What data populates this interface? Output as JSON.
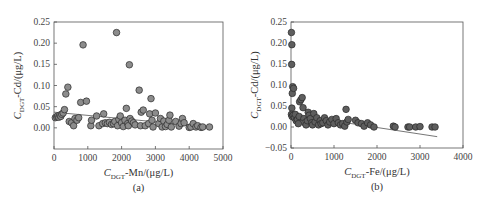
{
  "chart_data": [
    {
      "type": "scatter",
      "panel_label": "(a)",
      "title": "",
      "xlabel": "C_DGT-Mn/(μg/L)",
      "xlabel_parts": {
        "main": "C",
        "sub": "DGT",
        "rest": "-Mn/(μg/L)"
      },
      "ylabel": "C_DGT-Cd/(μg/L)",
      "ylabel_parts": {
        "main": "C",
        "sub": "DGT",
        "rest": "-Cd/(μg/L)"
      },
      "xlim": [
        0,
        5000
      ],
      "ylim": [
        -0.05,
        0.25
      ],
      "xticks": [
        "0",
        "1000",
        "2000",
        "3000",
        "4000",
        "5000"
      ],
      "yticks": [
        "0.00",
        "0.05",
        "0.10",
        "0.15",
        "0.20",
        "0.25"
      ],
      "grid": false,
      "marker_color": "#8c8c8c",
      "trendline": {
        "x": [
          0,
          4600
        ],
        "y": [
          0.037,
          0.002
        ]
      },
      "points": [
        [
          40,
          0.024
        ],
        [
          80,
          0.026
        ],
        [
          110,
          0.028
        ],
        [
          140,
          0.025
        ],
        [
          170,
          0.03
        ],
        [
          200,
          0.027
        ],
        [
          230,
          0.032
        ],
        [
          270,
          0.035
        ],
        [
          310,
          0.043
        ],
        [
          350,
          0.08
        ],
        [
          410,
          0.096
        ],
        [
          450,
          0.015
        ],
        [
          520,
          0.012
        ],
        [
          580,
          0.005
        ],
        [
          620,
          0.022
        ],
        [
          680,
          0.018
        ],
        [
          730,
          0.024
        ],
        [
          790,
          0.06
        ],
        [
          860,
          0.196
        ],
        [
          960,
          0.063
        ],
        [
          1090,
          0.005
        ],
        [
          1110,
          0.018
        ],
        [
          1260,
          0.028
        ],
        [
          1330,
          0.005
        ],
        [
          1440,
          0.01
        ],
        [
          1470,
          0.033
        ],
        [
          1520,
          0.012
        ],
        [
          1580,
          0.01
        ],
        [
          1640,
          0.013
        ],
        [
          1700,
          0.008
        ],
        [
          1760,
          0.01
        ],
        [
          1800,
          0.015
        ],
        [
          1850,
          0.225
        ],
        [
          1880,
          0.005
        ],
        [
          1920,
          0.02
        ],
        [
          1960,
          0.028
        ],
        [
          2000,
          0.012
        ],
        [
          2050,
          0.003
        ],
        [
          2100,
          0.018
        ],
        [
          2140,
          0.046
        ],
        [
          2180,
          0.01
        ],
        [
          2200,
          0.005
        ],
        [
          2230,
          0.149
        ],
        [
          2250,
          0.022
        ],
        [
          2300,
          0.016
        ],
        [
          2350,
          0.012
        ],
        [
          2400,
          0.007
        ],
        [
          2520,
          0.089
        ],
        [
          2560,
          0.005
        ],
        [
          2580,
          0.037
        ],
        [
          2640,
          0.042
        ],
        [
          2700,
          0.005
        ],
        [
          2800,
          0.01
        ],
        [
          2830,
          0.033
        ],
        [
          2870,
          0.069
        ],
        [
          2900,
          0.018
        ],
        [
          2930,
          0.002
        ],
        [
          3000,
          0.035
        ],
        [
          3100,
          0.01
        ],
        [
          3150,
          0.022
        ],
        [
          3200,
          0.002
        ],
        [
          3250,
          0.016
        ],
        [
          3300,
          0.003
        ],
        [
          3350,
          0.008
        ],
        [
          3400,
          0.018
        ],
        [
          3430,
          0.03
        ],
        [
          3470,
          0.002
        ],
        [
          3600,
          0.015
        ],
        [
          3700,
          0.004
        ],
        [
          3760,
          0.01
        ],
        [
          3800,
          0.022
        ],
        [
          3850,
          0.012
        ],
        [
          4000,
          0.001
        ],
        [
          4050,
          0.002
        ],
        [
          4120,
          0.01
        ],
        [
          4200,
          0.002
        ],
        [
          4250,
          0.005
        ],
        [
          4350,
          0.001
        ],
        [
          4400,
          0.002
        ],
        [
          4600,
          0.002
        ]
      ]
    },
    {
      "type": "scatter",
      "panel_label": "(b)",
      "title": "",
      "xlabel": "C_DGT-Fe/(μg/L)",
      "xlabel_parts": {
        "main": "C",
        "sub": "DGT",
        "rest": "-Fe/(μg/L)"
      },
      "ylabel": "C_DGT-Cd/(μg/L)",
      "ylabel_parts": {
        "main": "C",
        "sub": "DGT",
        "rest": "-Cd/(μg/L)"
      },
      "xlim": [
        0,
        4000
      ],
      "ylim": [
        -0.05,
        0.25
      ],
      "xticks": [
        "0",
        "1000",
        "2000",
        "3000",
        "4000"
      ],
      "yticks": [
        "-0.05",
        "0.00",
        "0.05",
        "0.10",
        "0.15",
        "0.20",
        "0.25"
      ],
      "grid": false,
      "marker_color": "#5e5e5e",
      "trendline": {
        "x": [
          0,
          3400
        ],
        "y": [
          0.03,
          -0.023
        ]
      },
      "points": [
        [
          10,
          0.225
        ],
        [
          20,
          0.196
        ],
        [
          15,
          0.149
        ],
        [
          30,
          0.08
        ],
        [
          40,
          0.096
        ],
        [
          60,
          0.092
        ],
        [
          20,
          0.045
        ],
        [
          10,
          0.03
        ],
        [
          25,
          0.025
        ],
        [
          50,
          0.028
        ],
        [
          80,
          0.022
        ],
        [
          100,
          0.03
        ],
        [
          120,
          0.015
        ],
        [
          150,
          0.018
        ],
        [
          170,
          0.008
        ],
        [
          190,
          0.025
        ],
        [
          200,
          0.06
        ],
        [
          230,
          0.065
        ],
        [
          260,
          0.07
        ],
        [
          280,
          0.046
        ],
        [
          300,
          0.02
        ],
        [
          320,
          0.01
        ],
        [
          350,
          0.005
        ],
        [
          380,
          0.015
        ],
        [
          400,
          0.035
        ],
        [
          420,
          0.028
        ],
        [
          450,
          0.02
        ],
        [
          480,
          0.01
        ],
        [
          500,
          0.005
        ],
        [
          530,
          0.032
        ],
        [
          560,
          0.012
        ],
        [
          600,
          0.022
        ],
        [
          640,
          0.005
        ],
        [
          680,
          0.015
        ],
        [
          700,
          0.008
        ],
        [
          740,
          0.01
        ],
        [
          780,
          0.022
        ],
        [
          820,
          0.015
        ],
        [
          860,
          0.005
        ],
        [
          900,
          0.012
        ],
        [
          950,
          0.018
        ],
        [
          1000,
          0.008
        ],
        [
          1050,
          0.02
        ],
        [
          1100,
          0.01
        ],
        [
          1150,
          0.005
        ],
        [
          1200,
          0.008
        ],
        [
          1250,
          0.002
        ],
        [
          1280,
          0.042
        ],
        [
          1300,
          0.012
        ],
        [
          1330,
          0.018
        ],
        [
          1500,
          0.016
        ],
        [
          1560,
          0.01
        ],
        [
          1640,
          0.008
        ],
        [
          1700,
          0.002
        ],
        [
          1780,
          0.01
        ],
        [
          1850,
          0.005
        ],
        [
          1930,
          0.0
        ],
        [
          2380,
          0.002
        ],
        [
          2420,
          0.0
        ],
        [
          2720,
          0.0
        ],
        [
          2760,
          0.0
        ],
        [
          2900,
          0.0
        ],
        [
          3000,
          0.001
        ],
        [
          3280,
          0.0
        ],
        [
          3350,
          0.0
        ]
      ]
    }
  ]
}
